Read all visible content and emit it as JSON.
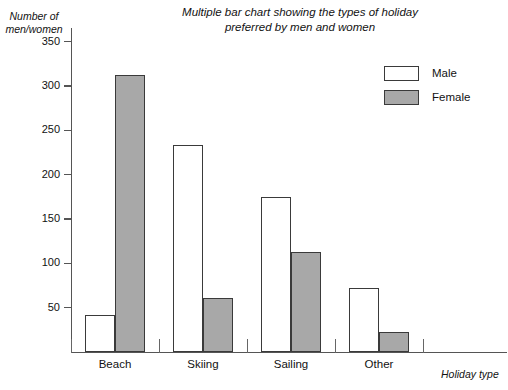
{
  "chart_data": {
    "type": "bar",
    "title": "Multiple bar chart showing the types of holiday preferred by men and women",
    "title_line1": "Multiple bar chart showing the types of holiday",
    "title_line2": "preferred by men and women",
    "xlabel": "Holiday type",
    "ylabel": "Number of men/women",
    "ylabel_line1": "Number of",
    "ylabel_line2": "men/women",
    "categories": [
      "Beach",
      "Skiing",
      "Sailing",
      "Other"
    ],
    "series": [
      {
        "name": "Male",
        "color": "#ffffff",
        "values": [
          42,
          233,
          175,
          72
        ]
      },
      {
        "name": "Female",
        "color": "#a8a8a8",
        "values": [
          312,
          61,
          113,
          23
        ]
      }
    ],
    "ylim": [
      0,
      370
    ],
    "yticks": [
      50,
      100,
      150,
      200,
      250,
      300,
      350
    ],
    "ytick_labels": [
      "50",
      "100",
      "150",
      "200",
      "250",
      "300",
      "350"
    ],
    "grid": false,
    "legend_position": "top-right"
  },
  "legend": {
    "entries": [
      {
        "label": "Male"
      },
      {
        "label": "Female"
      }
    ]
  }
}
